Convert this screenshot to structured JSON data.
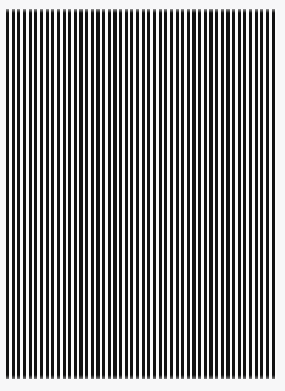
{
  "image": {
    "title": "Vertical Stripe Pattern",
    "kind": "optical-test-pattern",
    "width": 285,
    "height": 391
  },
  "colors": {
    "page_margin": "#f7f7f8",
    "stripe_dark": "#111111",
    "stripe_light": "#fbfbfb"
  },
  "pattern": {
    "orientation": "vertical",
    "field_left": 6,
    "field_top": 9,
    "field_width": 271,
    "field_height": 370,
    "period_px": 5.65,
    "bar_width_px": 3.2,
    "gap_width_px": 2.45,
    "bar_count": 48
  },
  "chart_data": {
    "type": "bar",
    "xlabel": "",
    "ylabel": "",
    "categories": [
      "1",
      "2",
      "3",
      "4",
      "5",
      "6",
      "7",
      "8",
      "9",
      "10",
      "11",
      "12",
      "13",
      "14",
      "15",
      "16",
      "17",
      "18",
      "19",
      "20",
      "21",
      "22",
      "23",
      "24",
      "25",
      "26",
      "27",
      "28",
      "29",
      "30",
      "31",
      "32",
      "33",
      "34",
      "35",
      "36",
      "37",
      "38",
      "39",
      "40",
      "41",
      "42",
      "43",
      "44",
      "45",
      "46",
      "47",
      "48"
    ],
    "values": [
      1,
      1,
      1,
      1,
      1,
      1,
      1,
      1,
      1,
      1,
      1,
      1,
      1,
      1,
      1,
      1,
      1,
      1,
      1,
      1,
      1,
      1,
      1,
      1,
      1,
      1,
      1,
      1,
      1,
      1,
      1,
      1,
      1,
      1,
      1,
      1,
      1,
      1,
      1,
      1,
      1,
      1,
      1,
      1,
      1,
      1,
      1,
      1
    ],
    "ylim": [
      0,
      1
    ],
    "grid": false,
    "legend": false
  }
}
